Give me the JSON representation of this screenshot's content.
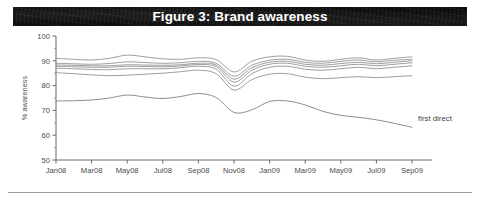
{
  "figure": {
    "title": "Figure 3: Brand awareness",
    "banner_color": "#0d0d0d",
    "banner_text_color": "#ffffff"
  },
  "annotations": [
    {
      "text": "first direct",
      "series": "first direct"
    }
  ],
  "chart_data": {
    "type": "line",
    "title": "Figure 3: Brand awareness",
    "xlabel": "",
    "ylabel": "% awareness",
    "ylim": [
      50,
      100
    ],
    "ytick_step": 10,
    "yticks": [
      50,
      60,
      70,
      80,
      90,
      100
    ],
    "yticks_minor": [
      55,
      65,
      75,
      85,
      95
    ],
    "grid": false,
    "legend_position": "inline-annotation-right",
    "line_color": "#8d8d8d",
    "x": [
      "Jan08",
      "Feb08",
      "Mar08",
      "Apr08",
      "May08",
      "Jun08",
      "Jul08",
      "Aug08",
      "Sep08",
      "Oct08",
      "Nov08",
      "Dec08",
      "Jan09",
      "Feb09",
      "Mar09",
      "Apr09",
      "May09",
      "Jun09",
      "Jul09",
      "Aug09",
      "Sep09"
    ],
    "xtick_labels": [
      "Jan08",
      "Mar08",
      "May08",
      "Jul08",
      "Sep08",
      "Nov08",
      "Jan09",
      "Mar09",
      "May09",
      "Jul09",
      "Sep09"
    ],
    "xtick_every": 2,
    "series": [
      {
        "name": "Brand A",
        "values": [
          91.0,
          90.6,
          90.3,
          91.0,
          92.3,
          91.6,
          90.8,
          90.6,
          91.2,
          90.5,
          85.5,
          89.8,
          91.6,
          91.8,
          90.3,
          89.8,
          90.6,
          91.2,
          90.3,
          91.0,
          91.6
        ]
      },
      {
        "name": "Brand B",
        "values": [
          89.0,
          88.8,
          88.6,
          88.9,
          89.6,
          89.3,
          89.0,
          89.2,
          89.8,
          89.0,
          83.8,
          88.2,
          90.2,
          90.6,
          89.4,
          89.0,
          89.8,
          90.3,
          89.6,
          90.2,
          90.6
        ]
      },
      {
        "name": "Brand C",
        "values": [
          88.3,
          88.2,
          88.0,
          88.0,
          88.4,
          88.3,
          88.2,
          88.4,
          89.0,
          88.3,
          82.6,
          87.2,
          89.4,
          89.8,
          88.6,
          88.2,
          88.9,
          89.4,
          88.8,
          89.4,
          90.0
        ]
      },
      {
        "name": "Brand D",
        "values": [
          87.8,
          87.6,
          87.4,
          87.4,
          87.8,
          87.7,
          87.6,
          87.9,
          88.5,
          87.6,
          81.4,
          86.2,
          88.6,
          89.0,
          87.8,
          87.4,
          88.0,
          88.6,
          88.0,
          88.6,
          89.2
        ]
      },
      {
        "name": "Brand E",
        "values": [
          87.0,
          86.8,
          86.5,
          86.4,
          86.8,
          86.8,
          86.8,
          87.2,
          87.8,
          86.6,
          79.8,
          84.8,
          87.4,
          87.8,
          86.6,
          86.2,
          86.8,
          87.4,
          86.8,
          87.4,
          88.0
        ]
      },
      {
        "name": "Brand F",
        "values": [
          85.2,
          84.8,
          84.3,
          84.0,
          84.2,
          84.6,
          85.0,
          85.6,
          86.2,
          84.8,
          78.2,
          82.4,
          84.6,
          84.8,
          83.4,
          82.8,
          83.2,
          83.6,
          83.2,
          83.6,
          84.0
        ]
      },
      {
        "name": "first direct",
        "values": [
          73.8,
          73.9,
          74.2,
          75.0,
          76.2,
          75.4,
          74.8,
          75.6,
          76.8,
          75.2,
          69.2,
          70.2,
          73.6,
          73.8,
          72.2,
          69.6,
          68.0,
          67.2,
          66.2,
          64.8,
          63.2
        ]
      }
    ]
  }
}
